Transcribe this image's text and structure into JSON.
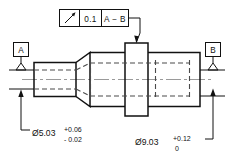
{
  "drawing": {
    "title": "Stepped shaft with circular runout control",
    "feature_control_frame": {
      "symbol_name": "circular-runout-symbol",
      "symbol_glyph": "↗",
      "tolerance": "0.1",
      "datum_reference": "A − B"
    },
    "datums": [
      {
        "id": "datum-a",
        "label": "A"
      },
      {
        "id": "datum-b",
        "label": "B"
      }
    ],
    "dimensions": [
      {
        "id": "left-diameter",
        "value": "Ø5.03",
        "upper_tolerance": "+0.06",
        "lower_tolerance": "- 0.02"
      },
      {
        "id": "right-diameter",
        "value": "Ø9.03",
        "upper_tolerance": "+0.12",
        "lower_tolerance": "0"
      }
    ],
    "colors": {
      "line": "#111111",
      "hidden_line": "#4a4a4a",
      "center_line": "#9a9a9a",
      "background": "#ffffff"
    }
  }
}
